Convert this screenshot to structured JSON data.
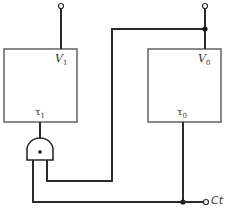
{
  "diagram": {
    "type": "circuit-block-diagram",
    "blocks": [
      {
        "id": "block-1",
        "output_label": "V",
        "output_sub": "1",
        "input_label": "τ",
        "input_sub": "1"
      },
      {
        "id": "block-0",
        "output_label": "V",
        "output_sub": "0",
        "input_label": "τ",
        "input_sub": "0"
      }
    ],
    "gate": {
      "type": "AND",
      "symbol": "•"
    },
    "terminal_label": "Ct",
    "colors": {
      "line": "#2a2a2a",
      "box": "#4a4a4a",
      "background": "#ffffff"
    }
  }
}
